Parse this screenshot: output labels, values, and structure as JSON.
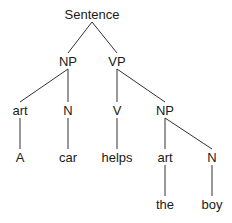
{
  "diagram": {
    "type": "parse-tree",
    "line_color": "#333333",
    "text_color": "#1a1a1a",
    "nodes": [
      {
        "id": "s",
        "label": "Sentence",
        "x": 92,
        "y": 14
      },
      {
        "id": "np1",
        "label": "NP",
        "x": 68,
        "y": 61
      },
      {
        "id": "vp",
        "label": "VP",
        "x": 117,
        "y": 61
      },
      {
        "id": "art1",
        "label": "art",
        "x": 20,
        "y": 110
      },
      {
        "id": "n1",
        "label": "N",
        "x": 68,
        "y": 110
      },
      {
        "id": "v",
        "label": "V",
        "x": 117,
        "y": 110
      },
      {
        "id": "np2",
        "label": "NP",
        "x": 165,
        "y": 110
      },
      {
        "id": "w_a",
        "label": "A",
        "x": 20,
        "y": 157
      },
      {
        "id": "w_car",
        "label": "car",
        "x": 68,
        "y": 157
      },
      {
        "id": "w_helps",
        "label": "helps",
        "x": 117,
        "y": 157
      },
      {
        "id": "art2",
        "label": "art",
        "x": 165,
        "y": 157
      },
      {
        "id": "n2",
        "label": "N",
        "x": 212,
        "y": 157
      },
      {
        "id": "w_the",
        "label": "the",
        "x": 165,
        "y": 204
      },
      {
        "id": "w_boy",
        "label": "boy",
        "x": 212,
        "y": 204
      }
    ],
    "edges": [
      {
        "from": "s",
        "to": "np1"
      },
      {
        "from": "s",
        "to": "vp"
      },
      {
        "from": "np1",
        "to": "art1"
      },
      {
        "from": "np1",
        "to": "n1"
      },
      {
        "from": "vp",
        "to": "v"
      },
      {
        "from": "vp",
        "to": "np2"
      },
      {
        "from": "art1",
        "to": "w_a"
      },
      {
        "from": "n1",
        "to": "w_car"
      },
      {
        "from": "v",
        "to": "w_helps"
      },
      {
        "from": "np2",
        "to": "art2"
      },
      {
        "from": "np2",
        "to": "n2"
      },
      {
        "from": "art2",
        "to": "w_the"
      },
      {
        "from": "n2",
        "to": "w_boy"
      }
    ]
  }
}
